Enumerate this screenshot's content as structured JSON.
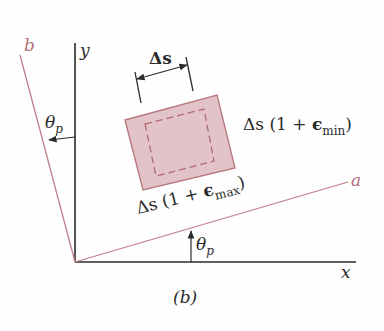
{
  "figure": {
    "caption": "(b)",
    "axes": {
      "x_label": "x",
      "y_label": "y",
      "a_label": "a",
      "b_label": "b"
    },
    "angles": {
      "theta_top": {
        "symbol": "θ",
        "subscript": "p"
      },
      "theta_bottom": {
        "symbol": "θ",
        "subscript": "p"
      }
    },
    "element": {
      "width_label": "Δs",
      "side_min_label": {
        "prefix": "Δs (1 + ",
        "epsilon": "ϵ",
        "subscript": "min",
        "suffix": ")"
      },
      "side_max_label": {
        "prefix": "Δs (1 + ",
        "epsilon": "ϵ",
        "subscript": "max",
        "suffix": ")"
      }
    },
    "colors": {
      "axis": "#2a2a2a",
      "rotated_axes": "#c08088",
      "element_fill": "#e2c3c7",
      "element_border": "#b87880",
      "dashed": "#b06a74"
    }
  }
}
